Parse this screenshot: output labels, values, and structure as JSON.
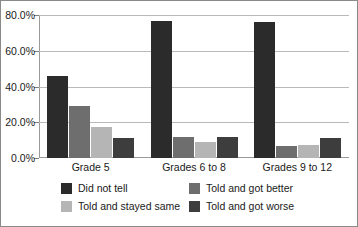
{
  "chart_data": {
    "type": "bar",
    "title": "",
    "xlabel": "",
    "ylabel": "",
    "ylim": [
      0,
      80
    ],
    "grid": true,
    "legend_position": "bottom",
    "categories": [
      "Grade 5",
      "Grades 6 to 8",
      "Grades 9 to 12"
    ],
    "ytick_labels": [
      "0.0%",
      "20.0%",
      "40.0%",
      "60.0%",
      "80.0%"
    ],
    "ytick_values": [
      0,
      20,
      40,
      60,
      80
    ],
    "series": [
      {
        "name": "Did not tell",
        "color": "#2b2b2b",
        "values": [
          46.0,
          76.5,
          76.0
        ]
      },
      {
        "name": "Told and got better",
        "color": "#6e6e6e",
        "values": [
          29.0,
          12.0,
          7.0
        ]
      },
      {
        "name": "Told and stayed same",
        "color": "#b5b5b5",
        "values": [
          17.5,
          9.0,
          7.5
        ]
      },
      {
        "name": "Told and got worse",
        "color": "#3d3d3d",
        "values": [
          11.0,
          12.0,
          11.0
        ]
      }
    ],
    "legend_order": [
      {
        "series_index": 0,
        "name": "Did not tell"
      },
      {
        "series_index": 1,
        "name": "Told and got better"
      },
      {
        "series_index": 2,
        "name": "Told and stayed same"
      },
      {
        "series_index": 3,
        "name": "Told and got worse"
      }
    ]
  },
  "colors": {
    "background": "#ffffff",
    "frame": "#8a8a8a",
    "axis": "#9a9a9a",
    "gridline": "#b9b9b9",
    "text": "#1a1a1a"
  }
}
